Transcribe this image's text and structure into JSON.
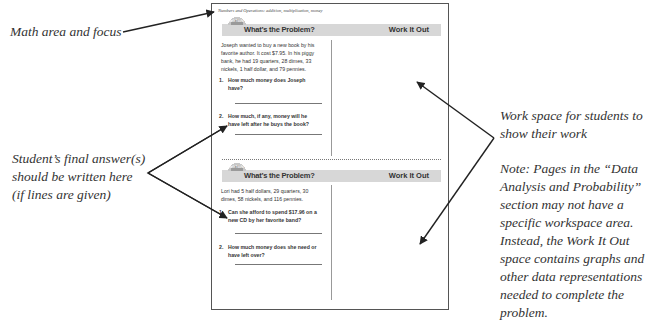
{
  "callouts": {
    "math_area": "Math area and focus",
    "final_answer": [
      "Student’s final answer(s)",
      "should be written here",
      "(if lines are given)"
    ],
    "work_space": [
      "Work space for students to",
      "show their work"
    ],
    "note": [
      "Note:  Pages in the “Data",
      "Analysis and Probability”",
      "section may not have a",
      "specific workspace area.",
      "Instead, the Work It Out",
      "space contains graphs and",
      "other data representations",
      "needed to complete the",
      "problem."
    ]
  },
  "page": {
    "math_area": "Numbers and Operations:  addition, multiplication, money",
    "badge_text": "Math Tools",
    "sections": [
      {
        "title_left": "What’s the Problem?",
        "title_right": "Work It Out",
        "problem": "Joseph wanted to buy a new book by his favorite author.  It cost $7.95.  In his piggy bank, he had 19 quarters, 28 dimes, 33 nickels, 1 half dollar, and 79 pennies.",
        "questions": [
          {
            "num": "1.",
            "text": "How much money does Joseph have?"
          },
          {
            "num": "2.",
            "text": "How much, if any, money will he have left after he buys the book?"
          }
        ]
      },
      {
        "title_left": "What’s the Problem?",
        "title_right": "Work It Out",
        "problem": "Lori had 5 half dollars, 29 quarters, 30 dimes, 58 nickels, and 116 pennies.",
        "questions": [
          {
            "num": "1.",
            "text": "Can she afford to spend $17.96 on a new CD by her favorite band?"
          },
          {
            "num": "2.",
            "text": "How much money does she need or have left over?"
          }
        ]
      }
    ]
  }
}
